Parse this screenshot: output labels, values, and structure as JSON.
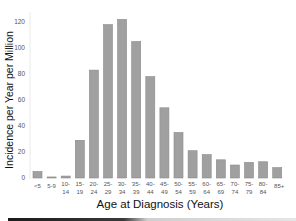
{
  "chart_data": {
    "type": "bar",
    "title": "",
    "xlabel": "Age at Diagnosis (Years)",
    "ylabel": "Incidence per Year per Million",
    "ylim": [
      0,
      120
    ],
    "yticks": [
      0,
      20,
      40,
      60,
      80,
      100,
      120
    ],
    "grid": false,
    "legend": null,
    "categories": [
      "<5",
      "5-9",
      "10-14",
      "15-19",
      "20-24",
      "25-29",
      "30-34",
      "35-39",
      "40-44",
      "45-49",
      "50-54",
      "55-59",
      "60-64",
      "65-69",
      "70-74",
      "75-79",
      "80-84",
      "85+"
    ],
    "category_labels": [
      [
        "<5"
      ],
      [
        "5-9"
      ],
      [
        "10-",
        "14"
      ],
      [
        "15-",
        "19"
      ],
      [
        "20-",
        "24"
      ],
      [
        "25-",
        "29"
      ],
      [
        "30-",
        "34"
      ],
      [
        "35-",
        "39"
      ],
      [
        "40-",
        "44"
      ],
      [
        "45-",
        "49"
      ],
      [
        "50-",
        "54"
      ],
      [
        "55-",
        "59"
      ],
      [
        "60-",
        "64"
      ],
      [
        "65-",
        "69"
      ],
      [
        "70-",
        "74"
      ],
      [
        "75-",
        "79"
      ],
      [
        "80-",
        "84"
      ],
      [
        "85+"
      ]
    ],
    "values": [
      5,
      0.8,
      1.5,
      29,
      83,
      118,
      122,
      105,
      78,
      54,
      35,
      21,
      18,
      14,
      10,
      12,
      12.5,
      8
    ],
    "bar_color": "#a0a0a0"
  }
}
